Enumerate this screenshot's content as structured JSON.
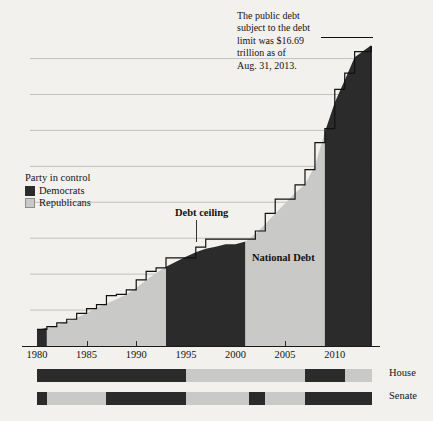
{
  "chart_data": {
    "type": "area",
    "title": "",
    "xlabel": "",
    "ylabel": "In trillions",
    "xlim": [
      1979.3,
      2013.75
    ],
    "ylim": [
      0,
      17.2
    ],
    "grid": true,
    "x_ticks": [
      "1980",
      "1985",
      "1990",
      "1995",
      "2000",
      "2005",
      "2010"
    ],
    "x_tick_values": [
      1980,
      1985,
      1990,
      1995,
      2000,
      2005,
      2010
    ],
    "y_ticks": [
      "$0",
      "$2",
      "$4",
      "$6",
      "$8",
      "$10",
      "$12",
      "$14",
      "$16"
    ],
    "y_tick_values": [
      0,
      2,
      4,
      6,
      8,
      10,
      12,
      14,
      16
    ],
    "series": [
      {
        "name": "National Debt",
        "type": "area",
        "x": [
          1980,
          1981,
          1982,
          1983,
          1984,
          1985,
          1986,
          1987,
          1988,
          1989,
          1990,
          1991,
          1992,
          1993,
          1994,
          1995,
          1996,
          1997,
          1998,
          1999,
          2000,
          2001,
          2002,
          2003,
          2004,
          2005,
          2006,
          2007,
          2008,
          2009,
          2010,
          2011,
          2012,
          2013.67
        ],
        "values": [
          0.91,
          1.0,
          1.14,
          1.38,
          1.57,
          1.82,
          2.12,
          2.35,
          2.6,
          2.87,
          3.23,
          3.67,
          4.06,
          4.41,
          4.69,
          4.97,
          5.22,
          5.41,
          5.53,
          5.66,
          5.67,
          5.81,
          6.23,
          6.78,
          7.38,
          7.93,
          8.51,
          9.01,
          10.02,
          11.91,
          13.56,
          14.79,
          16.07,
          16.74
        ]
      },
      {
        "name": "Debt ceiling",
        "type": "step",
        "x": [
          1980,
          1981,
          1982,
          1983,
          1984,
          1985,
          1986,
          1987,
          1988,
          1989,
          1990,
          1991,
          1992,
          1993,
          1994,
          1995,
          1996,
          1997,
          1998,
          1999,
          2000,
          2001,
          2002,
          2003,
          2004,
          2005,
          2006,
          2007,
          2008,
          2009,
          2010,
          2011,
          2012,
          2013.67
        ],
        "values": [
          0.93,
          1.08,
          1.29,
          1.49,
          1.82,
          2.08,
          2.3,
          2.8,
          2.87,
          3.12,
          3.68,
          4.15,
          4.35,
          4.9,
          4.9,
          4.9,
          5.5,
          5.95,
          5.95,
          5.95,
          5.95,
          5.95,
          6.4,
          7.38,
          8.18,
          8.18,
          8.97,
          9.82,
          11.32,
          12.1,
          14.29,
          15.19,
          16.39,
          16.7
        ]
      }
    ],
    "annotations": [
      {
        "name": "debt-limit-callout",
        "text": "The public debt subject to the debt limit was $16.69 trillion as of Aug. 31, 2013.",
        "lines": [
          "The public debt",
          "subject to the debt",
          "limit was $16.69",
          "trillion as of",
          "Aug. 31, 2013."
        ]
      },
      {
        "name": "debt-ceiling-label",
        "text": "Debt ceiling"
      },
      {
        "name": "national-debt-label",
        "text": "National Debt"
      }
    ],
    "legend": {
      "title": "Party in control",
      "position": "inside-left",
      "entries": [
        {
          "label": "Democrats",
          "color": "#2b2b2b"
        },
        {
          "label": "Republicans",
          "color": "#c9c9c7"
        }
      ]
    },
    "presidency_bands": [
      {
        "party": "Democrats",
        "start": 1980.0,
        "end": 1981.0
      },
      {
        "party": "Republicans",
        "start": 1981.0,
        "end": 1993.0
      },
      {
        "party": "Democrats",
        "start": 1993.0,
        "end": 2001.0
      },
      {
        "party": "Republicans",
        "start": 2001.0,
        "end": 2009.0
      },
      {
        "party": "Democrats",
        "start": 2009.0,
        "end": 2013.75
      }
    ],
    "control_bars": [
      {
        "name": "House",
        "label": "House",
        "segments": [
          {
            "party": "Democrats",
            "start": 1980.0,
            "end": 1995.0
          },
          {
            "party": "Republicans",
            "start": 1995.0,
            "end": 2007.0
          },
          {
            "party": "Democrats",
            "start": 2007.0,
            "end": 2011.0
          },
          {
            "party": "Republicans",
            "start": 2011.0,
            "end": 2013.75
          }
        ]
      },
      {
        "name": "Senate",
        "label": "Senate",
        "segments": [
          {
            "party": "Democrats",
            "start": 1980.0,
            "end": 1981.0
          },
          {
            "party": "Republicans",
            "start": 1981.0,
            "end": 1987.0
          },
          {
            "party": "Democrats",
            "start": 1987.0,
            "end": 1995.0
          },
          {
            "party": "Republicans",
            "start": 1995.0,
            "end": 2001.4
          },
          {
            "party": "Democrats",
            "start": 2001.4,
            "end": 2003.0
          },
          {
            "party": "Republicans",
            "start": 2003.0,
            "end": 2007.0
          },
          {
            "party": "Democrats",
            "start": 2007.0,
            "end": 2013.75
          }
        ]
      }
    ],
    "colors": {
      "democrat": "#2b2b2b",
      "republican": "#c9c9c7",
      "background": "#f2f1ee",
      "ceiling_line": "#111111",
      "gridline": "#b6b5b0"
    }
  }
}
